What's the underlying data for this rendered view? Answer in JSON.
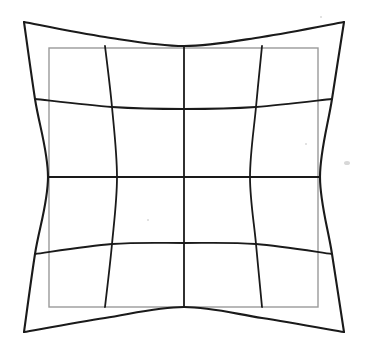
{
  "figure": {
    "background_color": "#ffffff",
    "width": 366,
    "height": 352
  },
  "reference_rectangle": {
    "name": "undistorted reference rectangle",
    "color": "#9a9a9a",
    "stroke_width": 1.4,
    "x": 49,
    "y": 48,
    "width": 269,
    "height": 259
  },
  "distorted_grid": {
    "name": "distorted 4x4 grid",
    "color": "#1a1a1a",
    "stroke_width_outer": 2.1,
    "stroke_width_inner": 1.8,
    "distortion_type": "pincushion",
    "corners": {
      "top_left": [
        24,
        22
      ],
      "top_right": [
        344,
        22
      ],
      "bottom_left": [
        24,
        332
      ],
      "bottom_right": [
        344,
        332
      ]
    },
    "center": [
      184,
      177
    ],
    "max_edge_deflection_px": 24,
    "cells_x": 4,
    "cells_y": 4
  },
  "chart_data": {
    "type": "line",
    "xlabel": "",
    "ylabel": "",
    "xlim": [
      0,
      366
    ],
    "ylim": [
      352,
      0
    ],
    "grid": false,
    "legend": "none",
    "annotations": [],
    "reference_rect": {
      "name": "Ideal rectangle",
      "color": "#9a9a9a",
      "x0": 49,
      "y0": 48,
      "x1": 318,
      "y1": 307
    },
    "series": [
      {
        "name": "distorted-v-0",
        "orientation": "vertical",
        "color": "#1a1a1a",
        "points": [
          [
            24,
            22
          ],
          [
            35,
            99
          ],
          [
            48,
            177
          ],
          [
            35,
            254
          ],
          [
            24,
            332
          ]
        ]
      },
      {
        "name": "distorted-v-1",
        "orientation": "vertical",
        "color": "#1a1a1a",
        "points": [
          [
            105,
            46
          ],
          [
            112,
            107
          ],
          [
            117,
            177
          ],
          [
            112,
            244
          ],
          [
            105,
            307
          ]
        ]
      },
      {
        "name": "distorted-v-2",
        "orientation": "vertical",
        "color": "#1a1a1a",
        "points": [
          [
            184,
            46
          ],
          [
            184,
            109
          ],
          [
            184,
            177
          ],
          [
            184,
            243
          ],
          [
            184,
            307
          ]
        ]
      },
      {
        "name": "distorted-v-3",
        "orientation": "vertical",
        "color": "#1a1a1a",
        "points": [
          [
            262,
            46
          ],
          [
            256,
            107
          ],
          [
            250,
            177
          ],
          [
            256,
            244
          ],
          [
            262,
            307
          ]
        ]
      },
      {
        "name": "distorted-v-4",
        "orientation": "vertical",
        "color": "#1a1a1a",
        "points": [
          [
            344,
            22
          ],
          [
            332,
            99
          ],
          [
            320,
            177
          ],
          [
            332,
            254
          ],
          [
            344,
            332
          ]
        ]
      },
      {
        "name": "distorted-h-0",
        "orientation": "horizontal",
        "color": "#1a1a1a",
        "points": [
          [
            24,
            22
          ],
          [
            105,
            37
          ],
          [
            184,
            46
          ],
          [
            262,
            37
          ],
          [
            344,
            22
          ]
        ]
      },
      {
        "name": "distorted-h-1",
        "orientation": "horizontal",
        "color": "#1a1a1a",
        "points": [
          [
            35,
            99
          ],
          [
            112,
            107
          ],
          [
            184,
            109
          ],
          [
            256,
            107
          ],
          [
            332,
            99
          ]
        ]
      },
      {
        "name": "distorted-h-2",
        "orientation": "horizontal",
        "color": "#1a1a1a",
        "points": [
          [
            48,
            177
          ],
          [
            117,
            177
          ],
          [
            184,
            177
          ],
          [
            250,
            177
          ],
          [
            320,
            177
          ]
        ]
      },
      {
        "name": "distorted-h-3",
        "orientation": "horizontal",
        "color": "#1a1a1a",
        "points": [
          [
            35,
            254
          ],
          [
            112,
            244
          ],
          [
            184,
            243
          ],
          [
            256,
            244
          ],
          [
            332,
            254
          ]
        ]
      },
      {
        "name": "distorted-h-4",
        "orientation": "horizontal",
        "color": "#1a1a1a",
        "points": [
          [
            24,
            332
          ],
          [
            105,
            318
          ],
          [
            184,
            307
          ],
          [
            262,
            318
          ],
          [
            344,
            332
          ]
        ]
      }
    ]
  }
}
